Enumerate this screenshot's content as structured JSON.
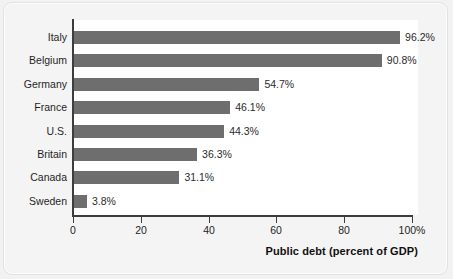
{
  "chart_data": {
    "type": "bar",
    "orientation": "horizontal",
    "title": "",
    "xlabel": "Public debt (percent of GDP)",
    "ylabel": "",
    "xlim": [
      0,
      100
    ],
    "grid": false,
    "legend": "none",
    "bar_color": "#6e6e6e",
    "plot_background": "#ffffff",
    "axis_color": "#3d3d3d",
    "categories": [
      "Italy",
      "Belgium",
      "Germany",
      "France",
      "U.S.",
      "Britain",
      "Canada",
      "Sweden"
    ],
    "values": [
      96.2,
      90.8,
      54.7,
      46.1,
      44.3,
      36.3,
      31.1,
      3.8
    ],
    "value_labels": [
      "96.2%",
      "90.8%",
      "54.7%",
      "46.1%",
      "44.3%",
      "36.3%",
      "31.1%",
      "3.8%"
    ],
    "x_ticks": [
      0,
      20,
      40,
      60,
      80,
      100
    ],
    "x_tick_labels": [
      "0",
      "20",
      "40",
      "60",
      "80",
      "100%"
    ]
  },
  "figure": {
    "background": "#f4f4f4",
    "border_color": "#e2e2e2"
  }
}
